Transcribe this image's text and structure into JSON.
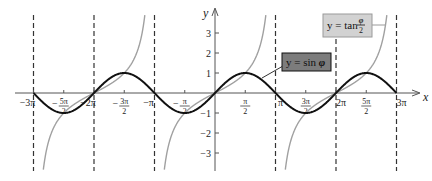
{
  "chart_data": {
    "type": "line",
    "title": "",
    "xlabel": "x",
    "ylabel": "y",
    "xlim_pi": [
      -3.3,
      3.35
    ],
    "ylim": [
      -3.9,
      3.9
    ],
    "grid": false,
    "x_ticks": [
      {
        "value_pi": -3,
        "label": "−3π",
        "frac": false
      },
      {
        "value_pi": -2.5,
        "num": "5π",
        "den": "2",
        "neg": true,
        "frac": true
      },
      {
        "value_pi": -2,
        "label": "−2π",
        "frac": false
      },
      {
        "value_pi": -1.5,
        "num": "3π",
        "den": "2",
        "neg": true,
        "frac": true
      },
      {
        "value_pi": -1,
        "label": "−π",
        "frac": false
      },
      {
        "value_pi": -0.5,
        "num": "π",
        "den": "2",
        "neg": true,
        "frac": true
      },
      {
        "value_pi": 0.5,
        "num": "π",
        "den": "2",
        "neg": false,
        "frac": true
      },
      {
        "value_pi": 1,
        "label": "π",
        "frac": false
      },
      {
        "value_pi": 1.5,
        "num": "3π",
        "den": "2",
        "neg": false,
        "frac": true
      },
      {
        "value_pi": 2,
        "label": "2π",
        "frac": false
      },
      {
        "value_pi": 2.5,
        "num": "5π",
        "den": "2",
        "neg": false,
        "frac": true
      },
      {
        "value_pi": 3,
        "label": "3π",
        "frac": false
      }
    ],
    "y_ticks": [
      {
        "value": 3,
        "label": "3"
      },
      {
        "value": 2,
        "label": "2"
      },
      {
        "value": 1,
        "label": "1"
      },
      {
        "value": -1,
        "label": "−1"
      },
      {
        "value": -2,
        "label": "−2"
      },
      {
        "value": -3,
        "label": "−3"
      }
    ],
    "dashed_vertical_lines_pi": [
      -3,
      -2,
      -1,
      1,
      2,
      3
    ],
    "series": [
      {
        "name": "y = sin φ",
        "function": "sin(phi)",
        "color": "#111111",
        "stroke_width": 2,
        "domain_pi": [
          -3,
          3
        ],
        "key_points": [
          {
            "x_pi": -3,
            "y": 0
          },
          {
            "x_pi": -2.5,
            "y": -1
          },
          {
            "x_pi": -2,
            "y": 0
          },
          {
            "x_pi": -1.5,
            "y": 1
          },
          {
            "x_pi": -1,
            "y": 0
          },
          {
            "x_pi": -0.5,
            "y": -1
          },
          {
            "x_pi": 0,
            "y": 0
          },
          {
            "x_pi": 0.5,
            "y": 1
          },
          {
            "x_pi": 1,
            "y": 0
          },
          {
            "x_pi": 1.5,
            "y": -1
          },
          {
            "x_pi": 2,
            "y": 0
          },
          {
            "x_pi": 2.5,
            "y": 1
          },
          {
            "x_pi": 3,
            "y": 0
          }
        ]
      },
      {
        "name": "y = tan (φ/2)",
        "function": "tan(phi/2)",
        "color": "#a0a0a0",
        "stroke_width": 1.4,
        "asymptotes_pi": [
          -3,
          -1,
          1,
          3
        ],
        "key_points": [
          {
            "x_pi": -2,
            "y": 0
          },
          {
            "x_pi": -1.5,
            "y": 1
          },
          {
            "x_pi": -2.5,
            "y": -1
          },
          {
            "x_pi": 0,
            "y": 0
          },
          {
            "x_pi": 0.5,
            "y": 1
          },
          {
            "x_pi": -0.5,
            "y": -1
          },
          {
            "x_pi": 2,
            "y": 0
          },
          {
            "x_pi": 2.5,
            "y": 1
          },
          {
            "x_pi": 1.5,
            "y": -1
          }
        ]
      }
    ],
    "annotations": [
      {
        "text": "y = sin φ",
        "box_fill": "#7c7c7c",
        "box_stroke": "#111111",
        "points_to_pi": 0.78
      },
      {
        "text": "y = tan φ/2",
        "box_fill": "#d2d2d2",
        "box_stroke": "#9a9a9a",
        "points_to_pi": 2.8
      }
    ]
  },
  "legend": {
    "sin": {
      "prefix": "y = sin ",
      "var": "φ"
    },
    "tan": {
      "prefix": "y = tan ",
      "num": "φ",
      "den": "2"
    }
  },
  "axes": {
    "x_label": "x",
    "y_label": "y"
  }
}
